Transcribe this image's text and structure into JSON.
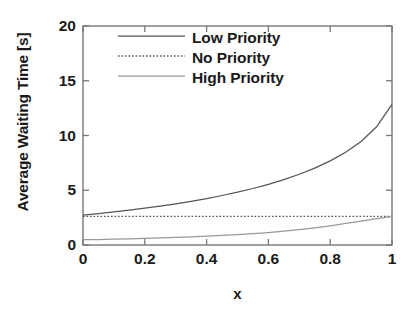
{
  "chart_data": {
    "type": "line",
    "title": "",
    "xlabel": "x",
    "ylabel": "Average Waiting Time [s]",
    "xlim": [
      0,
      1
    ],
    "ylim": [
      0,
      20
    ],
    "xticks": [
      "0",
      "0.2",
      "0.4",
      "0.6",
      "0.8",
      "1"
    ],
    "xtick_values": [
      0,
      0.2,
      0.4,
      0.6,
      0.8,
      1
    ],
    "yticks": [
      "0",
      "5",
      "10",
      "15",
      "20"
    ],
    "ytick_values": [
      0,
      5,
      10,
      15,
      20
    ],
    "grid": false,
    "legend_position": "top-center",
    "x": [
      0,
      0.05,
      0.1,
      0.15,
      0.2,
      0.25,
      0.3,
      0.35,
      0.4,
      0.45,
      0.5,
      0.55,
      0.6,
      0.65,
      0.7,
      0.75,
      0.8,
      0.85,
      0.9,
      0.95,
      1
    ],
    "series": [
      {
        "name": "Low Priority",
        "style": "solid",
        "color": "#555555",
        "values": [
          2.72,
          2.86,
          3.02,
          3.18,
          3.36,
          3.55,
          3.76,
          3.99,
          4.24,
          4.52,
          4.82,
          5.16,
          5.54,
          5.97,
          6.46,
          7.02,
          7.68,
          8.47,
          9.45,
          10.8,
          12.85
        ]
      },
      {
        "name": "No Priority",
        "style": "dotted",
        "color": "#555555",
        "values": [
          2.62,
          2.62,
          2.62,
          2.62,
          2.62,
          2.62,
          2.62,
          2.62,
          2.62,
          2.62,
          2.62,
          2.62,
          2.62,
          2.62,
          2.62,
          2.62,
          2.62,
          2.62,
          2.62,
          2.62,
          2.62
        ]
      },
      {
        "name": "High Priority",
        "style": "solid-light",
        "color": "#999999",
        "values": [
          0.48,
          0.5,
          0.53,
          0.56,
          0.6,
          0.64,
          0.69,
          0.74,
          0.8,
          0.87,
          0.95,
          1.04,
          1.14,
          1.26,
          1.4,
          1.56,
          1.75,
          1.97,
          2.18,
          2.4,
          2.6
        ]
      }
    ]
  },
  "legend": {
    "items": [
      {
        "label": "Low Priority"
      },
      {
        "label": "No Priority"
      },
      {
        "label": "High Priority"
      }
    ]
  },
  "axes": {
    "frame_color": "#777777"
  }
}
